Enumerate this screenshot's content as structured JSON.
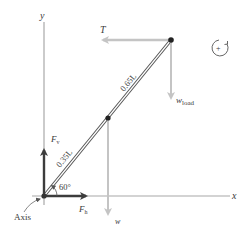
{
  "diagram": {
    "axes": {
      "x_label": "x",
      "y_label": "y"
    },
    "forces": {
      "tension": {
        "label": "T",
        "direction": "left"
      },
      "load_weight": {
        "label_main": "w",
        "label_sub": "load",
        "direction": "down"
      },
      "weight": {
        "label": "w",
        "direction": "down"
      },
      "vertical_reaction": {
        "label_main": "F",
        "label_sub": "v",
        "direction": "up"
      },
      "horizontal_reaction": {
        "label_main": "F",
        "label_sub": "h",
        "direction": "right"
      }
    },
    "segments": {
      "lower": "0.35L",
      "upper": "0.65L"
    },
    "angle": "60°",
    "pivot_label": "Axis",
    "rotation_sign": "+",
    "colors": {
      "axis": "#a8a8a8",
      "force_dark": "#3c3c3c",
      "force_light": "#c4c4c4",
      "beam": "#555555",
      "text": "#3a3a3a"
    }
  }
}
